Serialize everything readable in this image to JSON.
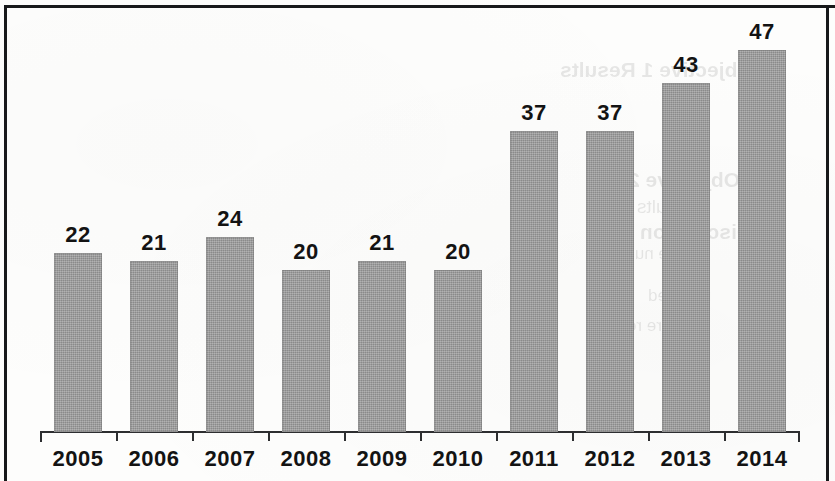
{
  "chart_data": {
    "type": "bar",
    "title": "",
    "subtitle": "",
    "xlabel": "",
    "ylabel": "",
    "categories": [
      "2005",
      "2006",
      "2007",
      "2008",
      "2009",
      "2010",
      "2011",
      "2012",
      "2013",
      "2014"
    ],
    "values": [
      22,
      21,
      24,
      20,
      21,
      20,
      37,
      37,
      43,
      47
    ],
    "data_labels": [
      "22",
      "21",
      "24",
      "20",
      "21",
      "20",
      "37",
      "37",
      "43",
      "47"
    ],
    "ylim": [
      0,
      47
    ],
    "grid": false,
    "legend": null,
    "legend_position": "none",
    "y_axis_visible": false,
    "y_tick_labels": [],
    "bar_color": "#9a9a9a",
    "label_color": "#131313",
    "axis_color": "#2d2e30",
    "annotations": []
  },
  "figure": {
    "frame_color": "#17181a",
    "background_color": "#fdfdfc"
  },
  "artifacts": {
    "description": "faint mirrored show-through text from reverse side of scanned page",
    "ghost_lines": [
      "Objective 1 Results",
      "Objective 2",
      "Results and",
      "Discussion",
      "of the number",
      "reported",
      "Figure results"
    ]
  }
}
